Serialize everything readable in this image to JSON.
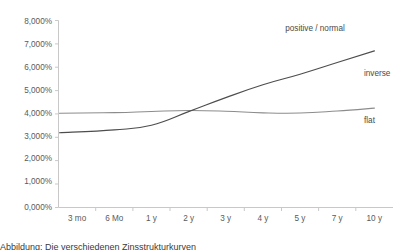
{
  "chart_data": {
    "type": "line",
    "title": "",
    "subtitle": "",
    "xlabel": "",
    "ylabel": "",
    "categories": [
      "3 mo",
      "6 Mo",
      "1 y",
      "2 y",
      "3 y",
      "4 y",
      "5 y",
      "7 y",
      "10 y"
    ],
    "ytick_labels": [
      "0,000%",
      "1,000%",
      "2,000%",
      "3,000%",
      "4,000%",
      "5,000%",
      "6,000%",
      "7,000%",
      "8,000%"
    ],
    "ytick_values": [
      0,
      1000,
      2000,
      3000,
      4000,
      5000,
      6000,
      7000,
      8000
    ],
    "ylim": [
      0,
      8000
    ],
    "grid": false,
    "legend_position": "inline-right",
    "series": [
      {
        "name": "positive / normal",
        "label": "positive / normal",
        "color": "#4d4d4d",
        "values": [
          3200,
          3320,
          3520,
          4100,
          4700,
          5250,
          5700,
          6200,
          6700
        ]
      },
      {
        "name": "flat",
        "label": "flat",
        "color": "#8c8c8c",
        "values": [
          4030,
          4060,
          4110,
          4150,
          4120,
          4050,
          4040,
          4130,
          4250
        ]
      }
    ],
    "annotations": [
      {
        "text": "positive / normal",
        "x_frac": 0.8,
        "y_value": 7200
      },
      {
        "text": "inverse",
        "x_frac": 0.935,
        "y_value": 5450
      },
      {
        "text": "flat",
        "x_frac": 0.935,
        "y_value": 3750
      }
    ]
  },
  "caption": {
    "text": "Abbildung: Die verschiedenen Zinsstrukturkurven"
  }
}
